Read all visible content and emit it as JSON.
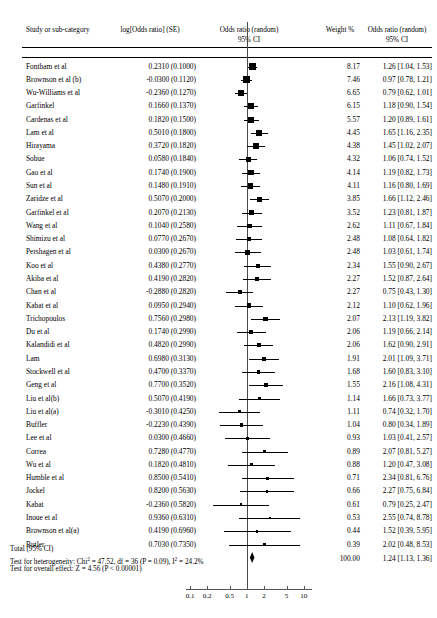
{
  "headers": {
    "study": "Study or sub-category",
    "logor": "log[Odds ratio] (SE)",
    "plot_line1": "Odds ratio (random)",
    "plot_line2": "95% CI",
    "weight": "Weight %",
    "or_line1": "Odds ratio (random)",
    "or_line2": "95% CI"
  },
  "total": {
    "label": "Total (95% CI)",
    "weight": "100.00",
    "or": "1.24 [1.13, 1.36]",
    "heterogeneity_pre": "Test for heterogeneity: Chi",
    "heterogeneity_mid": " = 47.52, df = 36 (P = 0.09), I",
    "heterogeneity_post": " = 24.2%",
    "overall": "Test for overall effect: Z = 4.56 (P < 0.00001)"
  },
  "axis": {
    "ticks": [
      "0.1",
      "0.2",
      "0.5",
      "1",
      "2",
      "5",
      "10"
    ],
    "values": [
      0.1,
      0.2,
      0.5,
      1,
      2,
      5,
      10
    ],
    "min": 0.085,
    "max": 14
  },
  "chart_data": {
    "type": "forest",
    "xlabel": "Odds ratio",
    "ylabel": "",
    "xscale": "log",
    "xlim": [
      0.085,
      14
    ],
    "xticks": [
      0.1,
      0.2,
      0.5,
      1,
      2,
      5,
      10
    ],
    "null_line": 1,
    "grid": false,
    "legend": "none",
    "columns": [
      "Study or sub-category",
      "log[Odds ratio] (SE)",
      "Weight %",
      "Odds ratio (random) 95% CI"
    ],
    "model": "random effects",
    "studies": [
      {
        "study": "Fontham et al",
        "logor": "0.2310 (0.1000)",
        "log": 0.231,
        "se": 0.1,
        "weight": "8.17",
        "w": 8.17,
        "or": "1.26 [1.04, 1.53]",
        "est": 1.26,
        "lo": 1.04,
        "hi": 1.53
      },
      {
        "study": "Brownson et al (b)",
        "logor": "-0.0300 (0.1120)",
        "log": -0.03,
        "se": 0.112,
        "weight": "7.46",
        "w": 7.46,
        "or": "0.97 [0.78, 1.21]",
        "est": 0.97,
        "lo": 0.78,
        "hi": 1.21
      },
      {
        "study": "Wu-Williams et al",
        "logor": "-0.2360 (0.1270)",
        "log": -0.236,
        "se": 0.127,
        "weight": "6.65",
        "w": 6.65,
        "or": "0.79 [0.62, 1.01]",
        "est": 0.79,
        "lo": 0.62,
        "hi": 1.01
      },
      {
        "study": "Garfinkel",
        "logor": "0.1660 (0.1370)",
        "log": 0.166,
        "se": 0.137,
        "weight": "6.15",
        "w": 6.15,
        "or": "1.18 [0.90, 1.54]",
        "est": 1.18,
        "lo": 0.9,
        "hi": 1.54
      },
      {
        "study": "Cardenas et al",
        "logor": "0.1820 (0.1500)",
        "log": 0.182,
        "se": 0.15,
        "weight": "5.57",
        "w": 5.57,
        "or": "1.20 [0.89, 1.61]",
        "est": 1.2,
        "lo": 0.89,
        "hi": 1.61
      },
      {
        "study": "Lam et al",
        "logor": "0.5010 (0.1800)",
        "log": 0.501,
        "se": 0.18,
        "weight": "4.45",
        "w": 4.45,
        "or": "1.65 [1.16, 2.35]",
        "est": 1.65,
        "lo": 1.16,
        "hi": 2.35
      },
      {
        "study": "Hirayama",
        "logor": "0.3720 (0.1820)",
        "log": 0.372,
        "se": 0.182,
        "weight": "4.38",
        "w": 4.38,
        "or": "1.45 [1.02, 2.07]",
        "est": 1.45,
        "lo": 1.02,
        "hi": 2.07
      },
      {
        "study": "Sobue",
        "logor": "0.0580 (0.1840)",
        "log": 0.058,
        "se": 0.184,
        "weight": "4.32",
        "w": 4.32,
        "or": "1.06 [0.74, 1.52]",
        "est": 1.06,
        "lo": 0.74,
        "hi": 1.52
      },
      {
        "study": "Gao et al",
        "logor": "0.1740 (0.1900)",
        "log": 0.174,
        "se": 0.19,
        "weight": "4.14",
        "w": 4.14,
        "or": "1.19 [0.82, 1.73]",
        "est": 1.19,
        "lo": 0.82,
        "hi": 1.73
      },
      {
        "study": "Sun et al",
        "logor": "0.1480 (0.1910)",
        "log": 0.148,
        "se": 0.191,
        "weight": "4.11",
        "w": 4.11,
        "or": "1.16 [0.80, 1.69]",
        "est": 1.16,
        "lo": 0.8,
        "hi": 1.69
      },
      {
        "study": "Zaridze et al",
        "logor": "0.5070 (0.2000)",
        "log": 0.507,
        "se": 0.2,
        "weight": "3.85",
        "w": 3.85,
        "or": "1.66 [1.12, 2.46]",
        "est": 1.66,
        "lo": 1.12,
        "hi": 2.46
      },
      {
        "study": "Garfinkel et al",
        "logor": "0.2070 (0.2130)",
        "log": 0.207,
        "se": 0.213,
        "weight": "3.52",
        "w": 3.52,
        "or": "1.23 [0.81, 1.87]",
        "est": 1.23,
        "lo": 0.81,
        "hi": 1.87
      },
      {
        "study": "Wang et al",
        "logor": "0.1040 (0.2580)",
        "log": 0.104,
        "se": 0.258,
        "weight": "2.62",
        "w": 2.62,
        "or": "1.11 [0.67, 1.84]",
        "est": 1.11,
        "lo": 0.67,
        "hi": 1.84
      },
      {
        "study": "Shimizu et al",
        "logor": "0.0770 (0.2670)",
        "log": 0.077,
        "se": 0.267,
        "weight": "2.48",
        "w": 2.48,
        "or": "1.08 [0.64, 1.82]",
        "est": 1.08,
        "lo": 0.64,
        "hi": 1.82
      },
      {
        "study": "Pershagen et al",
        "logor": "0.0300 (0.2670)",
        "log": 0.03,
        "se": 0.267,
        "weight": "2.48",
        "w": 2.48,
        "or": "1.03 [0.61, 1.74]",
        "est": 1.03,
        "lo": 0.61,
        "hi": 1.74
      },
      {
        "study": "Koo et al",
        "logor": "0.4380 (0.2770)",
        "log": 0.438,
        "se": 0.277,
        "weight": "2.34",
        "w": 2.34,
        "or": "1.55 [0.90, 2.67]",
        "est": 1.55,
        "lo": 0.9,
        "hi": 2.67
      },
      {
        "study": "Akiba et al",
        "logor": "0.4190 (0.2820)",
        "log": 0.419,
        "se": 0.282,
        "weight": "2.27",
        "w": 2.27,
        "or": "1.52 [0.87, 2.64]",
        "est": 1.52,
        "lo": 0.87,
        "hi": 2.64
      },
      {
        "study": "Chan et al",
        "logor": "-0.2880 (0.2820)",
        "log": -0.288,
        "se": 0.282,
        "weight": "2.27",
        "w": 2.27,
        "or": "0.75 [0.43, 1.30]",
        "est": 0.75,
        "lo": 0.43,
        "hi": 1.3
      },
      {
        "study": "Kabat et al",
        "logor": "0.0950 (0.2940)",
        "log": 0.095,
        "se": 0.294,
        "weight": "2.12",
        "w": 2.12,
        "or": "1.10 [0.62, 1.96]",
        "est": 1.1,
        "lo": 0.62,
        "hi": 1.96
      },
      {
        "study": "Trichopoulos",
        "logor": "0.7560  (0.2980)",
        "log": 0.756,
        "se": 0.298,
        "weight": "2.07",
        "w": 2.07,
        "or": "2.13 [1.19, 3.82]",
        "est": 2.13,
        "lo": 1.19,
        "hi": 3.82
      },
      {
        "study": "Du et al",
        "logor": "0.1740 (0.2990)",
        "log": 0.174,
        "se": 0.299,
        "weight": "2.06",
        "w": 2.06,
        "or": "1.19 [0.66, 2.14]",
        "est": 1.19,
        "lo": 0.66,
        "hi": 2.14
      },
      {
        "study": "Kalandidi et al",
        "logor": "0.4820 (0.2990)",
        "log": 0.482,
        "se": 0.299,
        "weight": "2.06",
        "w": 2.06,
        "or": "1.62 [0.90, 2.91]",
        "est": 1.62,
        "lo": 0.9,
        "hi": 2.91
      },
      {
        "study": "Lam",
        "logor": "0.6980 (0.3130)",
        "log": 0.698,
        "se": 0.313,
        "weight": "1.91",
        "w": 1.91,
        "or": "2.01 [1.09, 3.71]",
        "est": 2.01,
        "lo": 1.09,
        "hi": 3.71
      },
      {
        "study": "Stockwell et al",
        "logor": "0.4700  (0.3370)",
        "log": 0.47,
        "se": 0.337,
        "weight": "1.68",
        "w": 1.68,
        "or": "1.60 [0.83, 3.10]",
        "est": 1.6,
        "lo": 0.83,
        "hi": 3.1
      },
      {
        "study": "Geng et al",
        "logor": "0.7700 (0.3520)",
        "log": 0.77,
        "se": 0.352,
        "weight": "1.55",
        "w": 1.55,
        "or": "2.16 [1.08, 4.31]",
        "est": 2.16,
        "lo": 1.08,
        "hi": 4.31
      },
      {
        "study": "Liu et al(b)",
        "logor": "0.5070 (0.4190)",
        "log": 0.507,
        "se": 0.419,
        "weight": "1.14",
        "w": 1.14,
        "or": "1.66 [0.73, 3.77]",
        "est": 1.66,
        "lo": 0.73,
        "hi": 3.77
      },
      {
        "study": "Liu et al(a)",
        "logor": "-0.3010 (0.4250)",
        "log": -0.301,
        "se": 0.425,
        "weight": "1.11",
        "w": 1.11,
        "or": "0.74 [0.32, 1.70]",
        "est": 0.74,
        "lo": 0.32,
        "hi": 1.7
      },
      {
        "study": "Buffler",
        "logor": "-0.2230 (0.4390)",
        "log": -0.223,
        "se": 0.439,
        "weight": "1.04",
        "w": 1.04,
        "or": "0.80 [0.34, 1.89]",
        "est": 0.8,
        "lo": 0.34,
        "hi": 1.89
      },
      {
        "study": "Lee et al",
        "logor": "0.0300 (0.4660)",
        "log": 0.03,
        "se": 0.466,
        "weight": "0.93",
        "w": 0.93,
        "or": "1.03 [0.41, 2.57]",
        "est": 1.03,
        "lo": 0.41,
        "hi": 2.57
      },
      {
        "study": "Correa",
        "logor": "0.7280 (0.4770)",
        "log": 0.728,
        "se": 0.477,
        "weight": "0.89",
        "w": 0.89,
        "or": "2.07 [0.81, 5.27]",
        "est": 2.07,
        "lo": 0.81,
        "hi": 5.27
      },
      {
        "study": "Wu et al",
        "logor": "0.1820 (0.4810)",
        "log": 0.182,
        "se": 0.481,
        "weight": "0.88",
        "w": 0.88,
        "or": "1.20 [0.47, 3.08]",
        "est": 1.2,
        "lo": 0.47,
        "hi": 3.08
      },
      {
        "study": "Humble et al",
        "logor": "0.8500 (0.5410)",
        "log": 0.85,
        "se": 0.541,
        "weight": "0.71",
        "w": 0.71,
        "or": "2.34 [0.81, 6.76]",
        "est": 2.34,
        "lo": 0.81,
        "hi": 6.76
      },
      {
        "study": "Jockel",
        "logor": "0.8200 (0.5630)",
        "log": 0.82,
        "se": 0.563,
        "weight": "0.66",
        "w": 0.66,
        "or": "2.27 [0.75, 6.84]",
        "est": 2.27,
        "lo": 0.75,
        "hi": 6.84
      },
      {
        "study": "Kabat",
        "logor": "-0.2360 (0.5820)",
        "log": -0.236,
        "se": 0.582,
        "weight": "0.61",
        "w": 0.61,
        "or": "0.79 [0.25, 2.47]",
        "est": 0.79,
        "lo": 0.25,
        "hi": 2.47
      },
      {
        "study": "Inoue et al",
        "logor": "0.9360  (0.6310)",
        "log": 0.936,
        "se": 0.631,
        "weight": "0.53",
        "w": 0.53,
        "or": "2.55 [0.74, 8.78]",
        "est": 2.55,
        "lo": 0.74,
        "hi": 8.78
      },
      {
        "study": "Brownson et al(a)",
        "logor": "0.4190 (0.6960)",
        "log": 0.419,
        "se": 0.696,
        "weight": "0.44",
        "w": 0.44,
        "or": "1.52 [0.39, 5.95]",
        "est": 1.52,
        "lo": 0.39,
        "hi": 5.95
      },
      {
        "study": "Butler",
        "logor": "0.7030 (0.7350)",
        "log": 0.703,
        "se": 0.735,
        "weight": "0.39",
        "w": 0.39,
        "or": "2.02 [0.48, 8.53]",
        "est": 2.02,
        "lo": 0.48,
        "hi": 8.53
      }
    ],
    "summary": {
      "label": "Total (95% CI)",
      "weight": "100.00",
      "or": "1.24 [1.13, 1.36]",
      "est": 1.24,
      "lo": 1.13,
      "hi": 1.36
    },
    "heterogeneity": {
      "chi2": 47.52,
      "df": 36,
      "p": 0.09,
      "i2": "24.2%"
    },
    "overall_effect": {
      "z": 4.56,
      "p": "<0.00001"
    }
  }
}
